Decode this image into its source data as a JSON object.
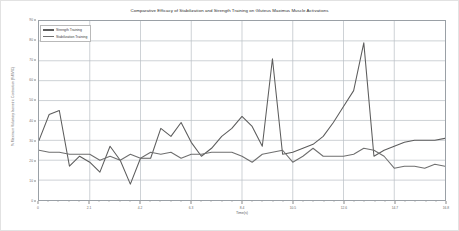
{
  "chart_data": {
    "type": "line",
    "title": "Comparative Efficacy of Stabilization and Strength Training on Gluteus Maximus Muscle Activations",
    "xlabel": "Time(s)",
    "ylabel": "% Maximum Voluntary Isometric Contraction (%MVIC)",
    "xlim": [
      0,
      16.8
    ],
    "ylim": [
      0,
      90
    ],
    "grid": true,
    "legend_position": "top-left",
    "yticks": [
      0,
      10,
      20,
      30,
      40,
      50,
      60,
      70,
      80,
      90
    ],
    "ytick_labels": [
      "0",
      "10",
      "20",
      "30",
      "40",
      "50",
      "60",
      "70",
      "80",
      "90"
    ],
    "xticks": [
      0,
      2.1,
      4.2,
      6.3,
      8.4,
      10.5,
      12.6,
      14.7,
      16.8
    ],
    "xtick_labels": [
      "0",
      "2.1",
      "4.2",
      "6.3",
      "8.4",
      "10.5",
      "12.6",
      "14.7",
      "16.8"
    ],
    "x": [
      0,
      0.42,
      0.84,
      1.26,
      1.68,
      2.1,
      2.52,
      2.94,
      3.36,
      3.78,
      4.2,
      4.62,
      5.04,
      5.46,
      5.88,
      6.3,
      6.72,
      7.14,
      7.56,
      7.98,
      8.4,
      8.82,
      9.24,
      9.66,
      10.08,
      10.5,
      10.92,
      11.34,
      11.76,
      12.18,
      12.6,
      13.02,
      13.44,
      13.86,
      14.28,
      14.7,
      15.12,
      15.54,
      15.96,
      16.38,
      16.8
    ],
    "series": [
      {
        "name": "Strength Training",
        "color": "#5c5c5c",
        "values": [
          30,
          43,
          45,
          17,
          22,
          19,
          14,
          27,
          20,
          8,
          21,
          21,
          36,
          32,
          39,
          29,
          22,
          26,
          32,
          36,
          42,
          37,
          27,
          71,
          23,
          24,
          26,
          28,
          32,
          39,
          47,
          55,
          79,
          22,
          25,
          27,
          29,
          30,
          30,
          30,
          31
        ]
      },
      {
        "name": "Stabilization Training",
        "color": "#6f6f6f",
        "values": [
          25,
          24,
          24,
          23,
          23,
          23,
          20,
          22,
          20,
          23,
          21,
          24,
          23,
          24,
          21,
          23,
          23,
          24,
          24,
          24,
          22,
          19,
          23,
          24,
          25,
          19,
          22,
          26,
          22,
          22,
          22,
          23,
          26,
          25,
          22,
          16,
          17,
          17,
          16,
          18,
          17
        ]
      }
    ]
  },
  "legend": {
    "items": [
      {
        "label": "Strength Training"
      },
      {
        "label": "Stabilization Training"
      }
    ]
  }
}
